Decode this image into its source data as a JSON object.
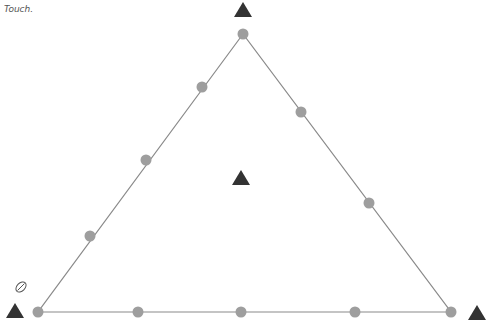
{
  "caption": "Touch.",
  "colors": {
    "edge": "#8a8a8a",
    "dot": "#9e9e9e",
    "triangle": "#333333"
  },
  "board": {
    "vertices": [
      {
        "name": "top",
        "x": 243,
        "y": 34
      },
      {
        "name": "bottom-left",
        "x": 38,
        "y": 312
      },
      {
        "name": "bottom-right",
        "x": 451,
        "y": 312
      }
    ],
    "dots": [
      {
        "x": 243,
        "y": 34
      },
      {
        "x": 202,
        "y": 87
      },
      {
        "x": 146,
        "y": 160
      },
      {
        "x": 90,
        "y": 236
      },
      {
        "x": 38,
        "y": 312
      },
      {
        "x": 301,
        "y": 112
      },
      {
        "x": 369,
        "y": 203
      },
      {
        "x": 451,
        "y": 312
      },
      {
        "x": 138,
        "y": 312
      },
      {
        "x": 241,
        "y": 312
      },
      {
        "x": 355,
        "y": 312
      }
    ],
    "markers": [
      {
        "name": "top-marker",
        "x": 243,
        "y": 10
      },
      {
        "name": "center-marker",
        "x": 241,
        "y": 178
      },
      {
        "name": "left-marker",
        "x": 15,
        "y": 311
      },
      {
        "name": "right-marker",
        "x": 477,
        "y": 313
      }
    ]
  },
  "icons": {
    "pencil": "pencil-icon"
  }
}
